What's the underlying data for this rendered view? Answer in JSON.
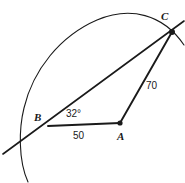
{
  "figure": {
    "type": "geometry-diagram",
    "stroke_color": "#1a1a1a",
    "background_color": "#ffffff",
    "width": 185,
    "height": 183
  },
  "vertices": {
    "a": {
      "label": "A",
      "x": 120,
      "y": 123
    },
    "b": {
      "label": "B",
      "x": 48,
      "y": 126
    },
    "c": {
      "label": "C",
      "x": 172,
      "y": 32
    }
  },
  "measures": {
    "angle_b": "32°",
    "side_ab": "50",
    "side_ac": "70"
  },
  "geometry": {
    "segment_ba": {
      "x1": 48,
      "y1": 126,
      "x2": 120,
      "y2": 123
    },
    "segment_ac": {
      "x1": 120,
      "y1": 123,
      "x2": 172,
      "y2": 32
    },
    "line_bc_extended": {
      "x1": 3,
      "y1": 154,
      "x2": 184,
      "y2": 21
    },
    "arc_path": "M 28 182 C 18 160 19 128 24 108 C 33 70 60 36 97 20 C 130 6 163 14 184 45",
    "point_markers": [
      {
        "name": "point-a-dot",
        "x": 120,
        "y": 123,
        "r": 2.6
      },
      {
        "name": "point-c-dot",
        "x": 172,
        "y": 32,
        "r": 3.0
      }
    ]
  }
}
